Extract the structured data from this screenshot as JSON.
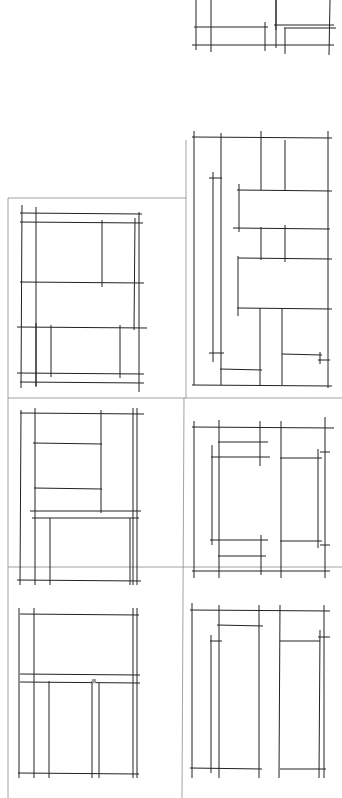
{
  "diagram": {
    "title": "",
    "background": "#ffffff",
    "line_color": "#222222",
    "grid_color": "#8a8a8a",
    "grid_lines": [
      {
        "x1": 8,
        "y1": 198,
        "x2": 186,
        "y2": 198
      },
      {
        "x1": 186,
        "y1": 140,
        "x2": 186,
        "y2": 398
      },
      {
        "x1": 8,
        "y1": 398,
        "x2": 342,
        "y2": 398
      },
      {
        "x1": 8,
        "y1": 198,
        "x2": 8,
        "y2": 798
      },
      {
        "x1": 8,
        "y1": 567,
        "x2": 342,
        "y2": 567
      },
      {
        "x1": 184,
        "y1": 398,
        "x2": 182,
        "y2": 798
      }
    ],
    "panels": [
      {
        "name": "panel-top-right-partial",
        "lines": [
          [
            196,
            0,
            196,
            50
          ],
          [
            211,
            0,
            211,
            52
          ],
          [
            276,
            0,
            276,
            48
          ],
          [
            330,
            0,
            329,
            55
          ],
          [
            194,
            27,
            268,
            27
          ],
          [
            265,
            22,
            265,
            51
          ],
          [
            274,
            25,
            334,
            25
          ],
          [
            284,
            28,
            336,
            28
          ],
          [
            285,
            28,
            285,
            54
          ],
          [
            276,
            0,
            276,
            30
          ],
          [
            192,
            45,
            334,
            45
          ]
        ]
      },
      {
        "name": "panel-a1",
        "lines": [
          [
            20,
            213,
            142,
            214
          ],
          [
            20,
            222,
            143,
            223
          ],
          [
            20,
            282,
            144,
            283
          ],
          [
            17,
            327,
            147,
            328
          ],
          [
            17,
            373,
            144,
            374
          ],
          [
            20,
            382,
            144,
            383
          ],
          [
            22,
            205,
            21,
            388
          ],
          [
            36,
            207,
            36,
            386
          ],
          [
            102,
            220,
            102,
            287
          ],
          [
            135,
            218,
            134,
            330
          ],
          [
            139,
            212,
            139,
            392
          ],
          [
            36,
            323,
            36,
            387
          ],
          [
            51,
            325,
            51,
            377
          ],
          [
            120,
            325,
            120,
            378
          ]
        ]
      },
      {
        "name": "panel-b1",
        "lines": [
          [
            192,
            137,
            332,
            138
          ],
          [
            237,
            190,
            332,
            191
          ],
          [
            233,
            228,
            330,
            229
          ],
          [
            238,
            258,
            332,
            259
          ],
          [
            237,
            308,
            332,
            309
          ],
          [
            194,
            131,
            194,
            385
          ],
          [
            221,
            133,
            221,
            385
          ],
          [
            261,
            131,
            261,
            190
          ],
          [
            285,
            140,
            285,
            191
          ],
          [
            328,
            131,
            328,
            388
          ],
          [
            239,
            184,
            239,
            232
          ],
          [
            261,
            227,
            261,
            260
          ],
          [
            285,
            225,
            285,
            262
          ],
          [
            238,
            256,
            238,
            316
          ],
          [
            213,
            172,
            213,
            362
          ],
          [
            209,
            178,
            222,
            178
          ],
          [
            209,
            353,
            224,
            353
          ],
          [
            220,
            369,
            262,
            370
          ],
          [
            260,
            308,
            260,
            385
          ],
          [
            282,
            308,
            282,
            385
          ],
          [
            282,
            354,
            322,
            355
          ],
          [
            320,
            352,
            320,
            364
          ],
          [
            318,
            360,
            330,
            360
          ],
          [
            192,
            385,
            332,
            386
          ]
        ]
      },
      {
        "name": "panel-a2",
        "lines": [
          [
            20,
            413,
            144,
            414
          ],
          [
            33,
            443,
            102,
            444
          ],
          [
            34,
            488,
            102,
            489
          ],
          [
            30,
            511,
            141,
            511
          ],
          [
            32,
            518,
            139,
            518
          ],
          [
            17,
            580,
            141,
            581
          ],
          [
            21,
            410,
            20,
            585
          ],
          [
            35,
            408,
            35,
            585
          ],
          [
            101,
            410,
            101,
            513
          ],
          [
            133,
            408,
            133,
            585
          ],
          [
            137,
            408,
            137,
            585
          ],
          [
            50,
            518,
            50,
            585
          ],
          [
            130,
            518,
            130,
            585
          ]
        ]
      },
      {
        "name": "panel-b2",
        "lines": [
          [
            192,
            427,
            334,
            428
          ],
          [
            218,
            442,
            268,
            442
          ],
          [
            211,
            457,
            270,
            457
          ],
          [
            280,
            458,
            322,
            458
          ],
          [
            210,
            540,
            268,
            540
          ],
          [
            280,
            541,
            322,
            541
          ],
          [
            218,
            556,
            266,
            556
          ],
          [
            192,
            571,
            330,
            571
          ],
          [
            194,
            421,
            194,
            578
          ],
          [
            219,
            420,
            219,
            578
          ],
          [
            260,
            421,
            260,
            466
          ],
          [
            261,
            535,
            261,
            575
          ],
          [
            281,
            421,
            281,
            578
          ],
          [
            325,
            417,
            325,
            578
          ],
          [
            212,
            445,
            212,
            545
          ],
          [
            318,
            449,
            318,
            548
          ],
          [
            320,
            452,
            330,
            452
          ],
          [
            320,
            545,
            330,
            545
          ]
        ]
      },
      {
        "name": "panel-a3",
        "lines": [
          [
            20,
            614,
            139,
            615
          ],
          [
            20,
            674,
            140,
            675
          ],
          [
            20,
            682,
            140,
            683
          ],
          [
            18,
            773,
            139,
            774
          ],
          [
            19,
            608,
            19,
            778
          ],
          [
            34,
            608,
            34,
            778
          ],
          [
            49,
            681,
            49,
            778
          ],
          [
            92,
            681,
            92,
            778
          ],
          [
            99,
            683,
            99,
            778
          ],
          [
            133,
            608,
            133,
            778
          ],
          [
            137,
            608,
            137,
            778
          ]
        ]
      },
      {
        "name": "panel-b3",
        "lines": [
          [
            190,
            610,
            330,
            611
          ],
          [
            217,
            625,
            263,
            626
          ],
          [
            210,
            641,
            222,
            641
          ],
          [
            280,
            641,
            320,
            641
          ],
          [
            318,
            637,
            330,
            637
          ],
          [
            190,
            768,
            262,
            769
          ],
          [
            280,
            769,
            326,
            769
          ],
          [
            192,
            603,
            192,
            778
          ],
          [
            211,
            635,
            211,
            773
          ],
          [
            219,
            605,
            219,
            778
          ],
          [
            259,
            605,
            259,
            778
          ],
          [
            280,
            605,
            279,
            778
          ],
          [
            320,
            630,
            319,
            778
          ],
          [
            324,
            605,
            324,
            778
          ]
        ]
      }
    ],
    "annotations": [
      {
        "name": "scan-mark",
        "x": 94,
        "y": 681,
        "text": ""
      }
    ]
  }
}
